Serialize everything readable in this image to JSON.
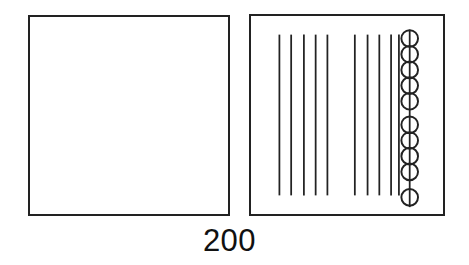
{
  "figure": {
    "caption": "200",
    "stroke_color": "#222222",
    "fill_color": "#ffffff",
    "background_color": "#ffffff"
  },
  "panels": [
    {
      "name": "left-panel",
      "role": "empty-square-region",
      "x": 28,
      "y": 15,
      "width": 202,
      "height": 201,
      "contents": []
    },
    {
      "name": "right-panel",
      "role": "hatched-square-region",
      "x": 249,
      "y": 14,
      "width": 196,
      "height": 202,
      "contents": [
        "vertical-line-group-left",
        "vertical-line-group-right",
        "circle-chain-column"
      ]
    }
  ],
  "vertical_lines": {
    "count_total": 10,
    "y_top": 33,
    "y_bottom": 197,
    "groups": [
      {
        "name": "vertical-line-group-left",
        "count": 5,
        "x_positions": [
          278,
          290,
          303,
          315,
          327
        ]
      },
      {
        "name": "vertical-line-group-right",
        "count": 5,
        "x_positions": [
          355,
          368,
          380,
          392,
          400
        ]
      }
    ]
  },
  "circle_chain": {
    "name": "circle-chain-column",
    "count": 10,
    "center_x": 411,
    "radius": 8.5,
    "axis_y_top": 28,
    "axis_y_bottom": 209,
    "centers_y": [
      37,
      53,
      69,
      85,
      101,
      125,
      141,
      157,
      173,
      199
    ]
  }
}
